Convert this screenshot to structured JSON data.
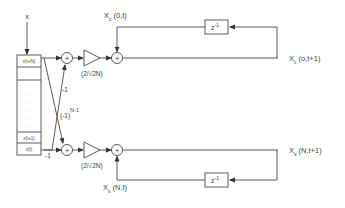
{
  "diagram": {
    "type": "block-diagram",
    "input": {
      "label": "x"
    },
    "shift_register": {
      "cells": [
        "x(t+N)",
        "",
        "·",
        "·",
        "·",
        "·",
        "·",
        "·",
        "x(t+1)",
        "x(t)"
      ]
    },
    "cross_coefficients": {
      "top": "-1",
      "bottom": "(-1)",
      "bottom_exponent": "N-1",
      "bottom_direct": "-1"
    },
    "top_branch": {
      "gain_label": "(2/√2N)",
      "gain_prefix": "(2/",
      "gain_sqrt": "√2N",
      "gain_suffix": ")",
      "delay_label": "z",
      "delay_exp": "-1",
      "state_in": {
        "base": "X",
        "sub": "c",
        "args": "(0,t)"
      },
      "state_out": {
        "base": "X",
        "sub": "c",
        "args": "(o,t+1)"
      }
    },
    "bottom_branch": {
      "gain_label": "(2/√2N)",
      "gain_prefix": "(2/",
      "gain_sqrt": "√2N",
      "gain_suffix": ")",
      "delay_label": "z",
      "delay_exp": "-1",
      "state_in": {
        "base": "X",
        "sub": "s",
        "args": "(N,t)"
      },
      "state_out": {
        "base": "X",
        "sub": "s",
        "args": "(N,t+1)"
      }
    },
    "adder_symbol": "+",
    "colors": {
      "stroke": "#4a4a4a",
      "text": "#444444",
      "background": "#ffffff"
    }
  }
}
